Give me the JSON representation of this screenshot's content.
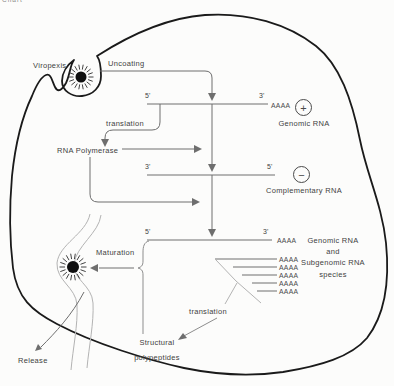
{
  "clipped_top_text": "Chart",
  "colors": {
    "membrane": "#1a1a1a",
    "diagram_line": "#6e6e6e",
    "light_line": "#b3b3b3",
    "text": "#3f3f3f",
    "background": "#fcfcfb"
  },
  "steps": {
    "viropexis": "Viropexis",
    "uncoating": "Uncoating",
    "translation_genomic": "translation",
    "rna_polymerase": "RNA Polymerase",
    "maturation": "Maturation",
    "translation_subgenomic": "translation",
    "release": "Release"
  },
  "strands": {
    "genomic": {
      "left_end": "5'",
      "right_end": "3'",
      "poly_a_tail": "AAAA",
      "polarity_symbol": "+",
      "label": "Genomic RNA"
    },
    "complementary": {
      "left_end": "3'",
      "right_end": "5'",
      "polarity_symbol": "−",
      "label": "Complementary RNA"
    },
    "genomic_and_subgenomic": {
      "left_end": "5'",
      "right_end": "3'",
      "poly_a_tail": "AAAA",
      "label_lines": [
        "Genomic RNA",
        "and",
        "Subgenomic RNA",
        "species"
      ],
      "subgenomic_tails": [
        "AAAA",
        "AAAA",
        "AAAA",
        "AAAA",
        "AAAA"
      ]
    }
  },
  "products": {
    "structural_polypeptides_lines": [
      "Structural",
      "polypeptides"
    ]
  }
}
